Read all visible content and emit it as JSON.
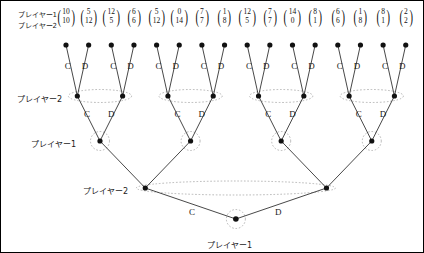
{
  "diagram": {
    "player_labels": {
      "player1": "プレイヤー1",
      "player2": "プレイヤー2"
    },
    "actions": {
      "cooperate": "C",
      "defect": "D"
    },
    "colors": {
      "node": "#111111",
      "edge": "#333333",
      "infoset": "#999999",
      "text": "#1a1a1a",
      "border": "#000000"
    },
    "payoff_header": {
      "row1": "プレイヤー1",
      "row2": "プレイヤー2"
    },
    "payoffs": [
      {
        "p1": "10",
        "p2": "10"
      },
      {
        "p1": "5",
        "p2": "12"
      },
      {
        "p1": "12",
        "p2": "5"
      },
      {
        "p1": "6",
        "p2": "6"
      },
      {
        "p1": "5",
        "p2": "12"
      },
      {
        "p1": "0",
        "p2": "14"
      },
      {
        "p1": "7",
        "p2": "7"
      },
      {
        "p1": "1",
        "p2": "8"
      },
      {
        "p1": "12",
        "p2": "5"
      },
      {
        "p1": "7",
        "p2": "7"
      },
      {
        "p1": "14",
        "p2": "0"
      },
      {
        "p1": "8",
        "p2": "1"
      },
      {
        "p1": "6",
        "p2": "6"
      },
      {
        "p1": "1",
        "p2": "8"
      },
      {
        "p1": "8",
        "p2": "1"
      },
      {
        "p1": "2",
        "p2": "2"
      }
    ],
    "level_labels": [
      {
        "text": "プレイヤー2",
        "x": 16,
        "y": 92
      },
      {
        "text": "プレイヤー1",
        "x": 30,
        "y": 137
      },
      {
        "text": "プレイヤー2",
        "x": 82,
        "y": 184
      },
      {
        "text": "プレイヤー1",
        "x": 206,
        "y": 238
      }
    ],
    "edge_labels_level1": [
      "C",
      "D",
      "C",
      "D",
      "C",
      "D",
      "C",
      "D",
      "C",
      "D",
      "C",
      "D",
      "C",
      "D",
      "C",
      "D"
    ],
    "edge_labels_level2": [
      "C",
      "D",
      "C",
      "D",
      "C",
      "D",
      "C",
      "D"
    ],
    "edge_labels_level3": [
      "C",
      "D"
    ]
  }
}
